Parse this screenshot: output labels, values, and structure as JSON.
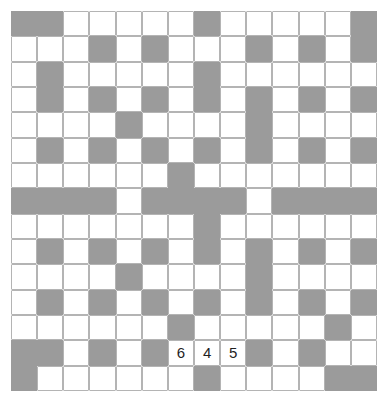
{
  "puzzle": {
    "name": "crossword-grid",
    "rows": 15,
    "columns": 14,
    "colors": {
      "block": "#9b9b9b",
      "open": "#ffffff",
      "gridline": "#b4b4b4",
      "background": "#ffffff",
      "text": "#1f1f1f"
    },
    "legend": {
      "block_code": "B",
      "open_code": "O"
    },
    "grid": [
      [
        "B",
        "B",
        "O",
        "O",
        "O",
        "O",
        "O",
        "B",
        "O",
        "O",
        "O",
        "O",
        "O",
        "B"
      ],
      [
        "O",
        "O",
        "O",
        "B",
        "O",
        "B",
        "O",
        "O",
        "O",
        "B",
        "O",
        "B",
        "O",
        "B"
      ],
      [
        "O",
        "B",
        "O",
        "O",
        "O",
        "O",
        "O",
        "B",
        "O",
        "O",
        "O",
        "O",
        "O",
        "O"
      ],
      [
        "O",
        "B",
        "O",
        "B",
        "O",
        "B",
        "O",
        "B",
        "O",
        "B",
        "O",
        "B",
        "O",
        "B"
      ],
      [
        "O",
        "O",
        "O",
        "O",
        "B",
        "O",
        "O",
        "O",
        "O",
        "B",
        "O",
        "O",
        "O",
        "O"
      ],
      [
        "O",
        "B",
        "O",
        "B",
        "O",
        "B",
        "O",
        "B",
        "O",
        "B",
        "O",
        "B",
        "O",
        "B"
      ],
      [
        "O",
        "O",
        "O",
        "O",
        "O",
        "O",
        "B",
        "O",
        "O",
        "O",
        "O",
        "O",
        "O",
        "O"
      ],
      [
        "B",
        "B",
        "B",
        "B",
        "O",
        "B",
        "B",
        "B",
        "B",
        "O",
        "B",
        "B",
        "B",
        "B"
      ],
      [
        "O",
        "O",
        "O",
        "O",
        "O",
        "O",
        "O",
        "B",
        "O",
        "O",
        "O",
        "O",
        "O",
        "O"
      ],
      [
        "O",
        "B",
        "O",
        "B",
        "O",
        "B",
        "O",
        "B",
        "O",
        "B",
        "O",
        "B",
        "O",
        "B"
      ],
      [
        "O",
        "O",
        "O",
        "O",
        "B",
        "O",
        "O",
        "O",
        "O",
        "B",
        "O",
        "O",
        "O",
        "O"
      ],
      [
        "O",
        "B",
        "O",
        "B",
        "O",
        "B",
        "O",
        "B",
        "O",
        "B",
        "O",
        "B",
        "O",
        "B"
      ],
      [
        "O",
        "O",
        "O",
        "O",
        "O",
        "O",
        "B",
        "O",
        "O",
        "O",
        "O",
        "O",
        "B",
        "O"
      ],
      [
        "B",
        "B",
        "O",
        "B",
        "O",
        "B",
        "O",
        "O",
        "O",
        "B",
        "O",
        "B",
        "O",
        "O"
      ],
      [
        "B",
        "O",
        "O",
        "O",
        "O",
        "O",
        "O",
        "B",
        "O",
        "O",
        "O",
        "O",
        "B",
        "B"
      ]
    ],
    "numbers": [
      {
        "row": 14,
        "col": 7,
        "label": "6"
      },
      {
        "row": 14,
        "col": 8,
        "label": "4"
      },
      {
        "row": 14,
        "col": 9,
        "label": "5"
      }
    ]
  }
}
